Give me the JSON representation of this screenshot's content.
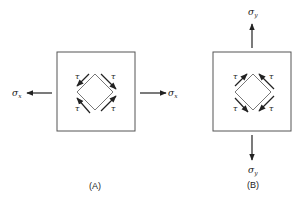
{
  "panels": [
    {
      "id": "A",
      "caption": "(A)",
      "stress_label": "σ",
      "stress_subscript": "x",
      "shear_label": "τ",
      "shear_labels": [
        "τ",
        "τ",
        "τ",
        "τ"
      ],
      "applied_direction": "horizontal"
    },
    {
      "id": "B",
      "caption": "(B)",
      "stress_label": "σ",
      "stress_subscript": "y",
      "shear_label": "τ",
      "shear_labels": [
        "τ",
        "τ",
        "τ",
        "τ"
      ],
      "applied_direction": "vertical"
    }
  ],
  "colors": {
    "stroke": "#333333",
    "background": "#ffffff"
  }
}
